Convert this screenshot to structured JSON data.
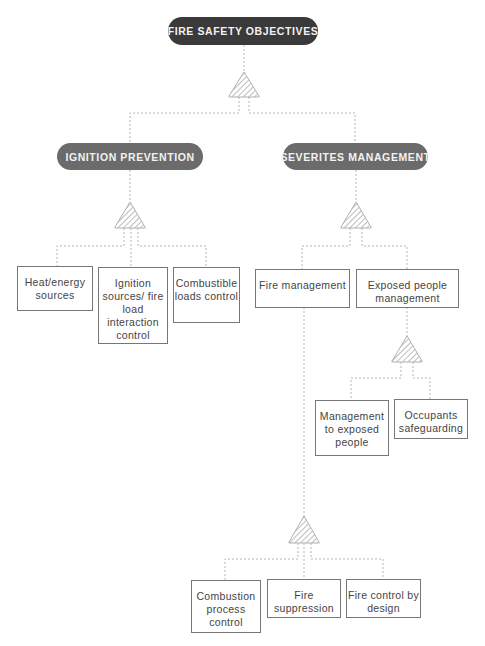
{
  "root": {
    "label": "FIRE SAFETY OBJECTIVES"
  },
  "branches": [
    {
      "label": "IGNITION PREVENTION"
    },
    {
      "label": "SEVERITES MANAGEMENT"
    }
  ],
  "ignition_children": [
    {
      "label": "Heat/energy sources"
    },
    {
      "label": "Ignition sources/ fire load interaction control"
    },
    {
      "label": "Combustible loads control"
    }
  ],
  "severity_children": [
    {
      "label": "Fire management"
    },
    {
      "label": "Exposed people management"
    }
  ],
  "exposed_children": [
    {
      "label": "Management to exposed people"
    },
    {
      "label": "Occupants safeguarding"
    }
  ],
  "fire_children": [
    {
      "label": "Combustion process control"
    },
    {
      "label": "Fire suppression"
    },
    {
      "label": "Fire control by design"
    }
  ],
  "colors": {
    "root": "#3a3a3a",
    "branch": "#6b6b6b",
    "box_border": "#777777",
    "connector": "#bbbbbb"
  }
}
